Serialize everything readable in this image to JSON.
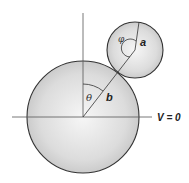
{
  "diagram": {
    "type": "geometry",
    "labels": {
      "theta": "θ",
      "phi": "φ",
      "a": "a",
      "b": "b",
      "potential": "V = 0"
    },
    "colors": {
      "sphere_fill_center": "#f4f4f4",
      "sphere_fill_edge": "#c8c8c8",
      "outline": "#333333",
      "axis": "#555555"
    },
    "large_sphere": {
      "cx": 83,
      "cy": 117,
      "r": 56,
      "radius_label": "b"
    },
    "small_sphere": {
      "cx": 135,
      "cy": 50,
      "r": 28,
      "radius_label": "a"
    }
  }
}
